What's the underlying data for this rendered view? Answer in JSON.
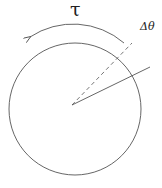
{
  "diagram": {
    "labels": {
      "torque": "τ",
      "angle": "Δθ"
    },
    "colors": {
      "stroke": "#555555",
      "text": "#222222"
    },
    "elements": [
      "circle",
      "torque-arrow-arc",
      "dashed-radius",
      "solid-radius"
    ]
  }
}
